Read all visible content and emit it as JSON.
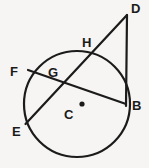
{
  "figure": {
    "background_color": "#f6f5f3",
    "stroke_color": "#1b1b1b",
    "label_color": "#1b1b1b"
  },
  "labels": {
    "D": "D",
    "H": "H",
    "F": "F",
    "G": "G",
    "C": "C",
    "E": "E",
    "B": "B"
  },
  "geometry": {
    "circle": {
      "cx": 77,
      "cy": 104,
      "r": 53,
      "stroke_width": 2.2
    },
    "center_dot": {
      "cx": 82,
      "cy": 104,
      "r": 2.6
    },
    "points": {
      "D": {
        "x": 127,
        "y": 15
      },
      "H": {
        "x": 95,
        "y": 52
      },
      "G": {
        "x": 62,
        "y": 87
      },
      "E": {
        "x": 25.5,
        "y": 124
      },
      "F": {
        "x": 28,
        "y": 70
      },
      "B": {
        "x": 126,
        "y": 104
      },
      "C": {
        "x": 77,
        "y": 104
      }
    },
    "segments": [
      {
        "name": "secant-D-E",
        "from": "D",
        "to": "E"
      },
      {
        "name": "tangent-D-B",
        "from": "D",
        "to": "B"
      },
      {
        "name": "chord-F-B",
        "from": "F",
        "to": "B"
      }
    ]
  },
  "label_positions": {
    "D": {
      "x": 131,
      "y": 2
    },
    "H": {
      "x": 82,
      "y": 36
    },
    "F": {
      "x": 10,
      "y": 65
    },
    "G": {
      "x": 48,
      "y": 66
    },
    "C": {
      "x": 64,
      "y": 108
    },
    "E": {
      "x": 12,
      "y": 125
    },
    "B": {
      "x": 132,
      "y": 99
    }
  }
}
